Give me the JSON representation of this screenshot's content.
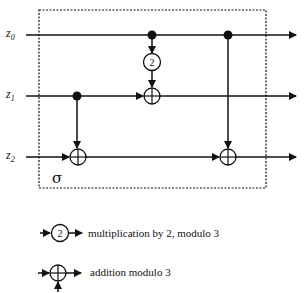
{
  "diagram": {
    "block_label": "σ",
    "inputs": [
      {
        "label": "z",
        "subscript": "0"
      },
      {
        "label": "z",
        "subscript": "1"
      },
      {
        "label": "z",
        "subscript": "2"
      }
    ],
    "multiplier_label": "2",
    "colors": {
      "stroke": "#111111",
      "background": "#ffffff"
    }
  },
  "legend": {
    "items": [
      {
        "symbol": "2",
        "text": "multiplication by 2, modulo 3"
      },
      {
        "symbol": "⊕",
        "text": "addition modulo 3"
      }
    ]
  }
}
